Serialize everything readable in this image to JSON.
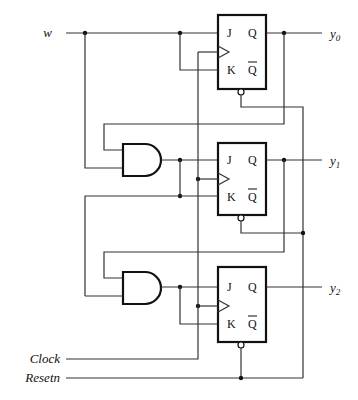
{
  "diagram": {
    "type": "sequential circuit",
    "inputs": {
      "w": "w",
      "clock": "Clock",
      "reset": "Resetn"
    },
    "outputs": [
      {
        "name": "y",
        "sub": "0"
      },
      {
        "name": "y",
        "sub": "1"
      },
      {
        "name": "y",
        "sub": "2"
      }
    ],
    "flip_flops": [
      {
        "type": "JK",
        "pins": {
          "j": "J",
          "k": "K",
          "q": "Q",
          "qbar": "Q"
        }
      },
      {
        "type": "JK",
        "pins": {
          "j": "J",
          "k": "K",
          "q": "Q",
          "qbar": "Q"
        }
      },
      {
        "type": "JK",
        "pins": {
          "j": "J",
          "k": "K",
          "q": "Q",
          "qbar": "Q"
        }
      }
    ],
    "gates": [
      {
        "type": "AND",
        "inputs": 2
      },
      {
        "type": "AND",
        "inputs": 2
      }
    ],
    "caption": "Figure 8.??  ..."
  },
  "colors": {
    "line": "#333333",
    "background": "#ffffff"
  }
}
